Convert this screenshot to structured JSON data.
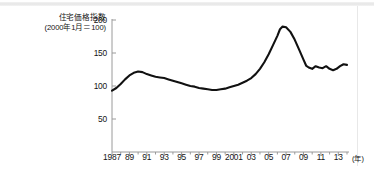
{
  "figure": {
    "background_color": "#ffffff",
    "line_color": "#111111",
    "axis_color": "#9a9a9a"
  },
  "title": {
    "main": "住宅価格指数",
    "sub": "(2000年1月＝100)"
  },
  "axis": {
    "x_unit": "(年)",
    "y_ticks": [
      "200",
      "150",
      "100",
      "50"
    ],
    "x_ticks": [
      "1987",
      "89",
      "91",
      "93",
      "95",
      "97",
      "99",
      "2001",
      "03",
      "05",
      "07",
      "09",
      "11",
      "13"
    ]
  },
  "chart_data": {
    "type": "line",
    "title": "住宅価格指数",
    "subtitle": "(2000年1月＝100)",
    "xlabel": "(年)",
    "ylabel": "住宅価格指数",
    "ylim": [
      0,
      200
    ],
    "xlim": [
      1987,
      2014
    ],
    "grid": false,
    "legend": null,
    "yticks": [
      50,
      100,
      150,
      200
    ],
    "xticks": [
      1987,
      1989,
      1991,
      1993,
      1995,
      1997,
      1999,
      2001,
      2003,
      2005,
      2007,
      2009,
      2011,
      2013
    ],
    "xtick_labels": [
      "1987",
      "89",
      "91",
      "93",
      "95",
      "97",
      "99",
      "2001",
      "03",
      "05",
      "07",
      "09",
      "11",
      "13"
    ],
    "series": [
      {
        "name": "住宅価格指数",
        "color": "#111111",
        "x": [
          1987.0,
          1987.5,
          1988.0,
          1988.5,
          1989.0,
          1989.5,
          1990.0,
          1990.5,
          1991.0,
          1991.5,
          1992.0,
          1992.5,
          1993.0,
          1993.5,
          1994.0,
          1994.5,
          1995.0,
          1995.5,
          1996.0,
          1996.5,
          1997.0,
          1997.5,
          1998.0,
          1998.5,
          1999.0,
          1999.5,
          2000.0,
          2000.5,
          2001.0,
          2001.5,
          2002.0,
          2002.5,
          2003.0,
          2003.5,
          2004.0,
          2004.5,
          2005.0,
          2005.5,
          2006.0,
          2006.3,
          2006.6,
          2007.0,
          2007.5,
          2008.0,
          2008.5,
          2009.0,
          2009.3,
          2009.6,
          2010.0,
          2010.4,
          2010.8,
          2011.2,
          2011.6,
          2012.0,
          2012.4,
          2012.8,
          2013.2,
          2013.6,
          2014.0
        ],
        "values": [
          93,
          97,
          103,
          110,
          116,
          120,
          122,
          121,
          118,
          116,
          114,
          113,
          112,
          110,
          108,
          106,
          104,
          102,
          100,
          99,
          97,
          96,
          95,
          94,
          94,
          95,
          96,
          98,
          100,
          102,
          105,
          108,
          112,
          118,
          126,
          136,
          148,
          162,
          176,
          186,
          190,
          189,
          182,
          170,
          155,
          140,
          131,
          128,
          126,
          130,
          128,
          127,
          130,
          126,
          124,
          126,
          130,
          133,
          132
        ]
      }
    ]
  }
}
